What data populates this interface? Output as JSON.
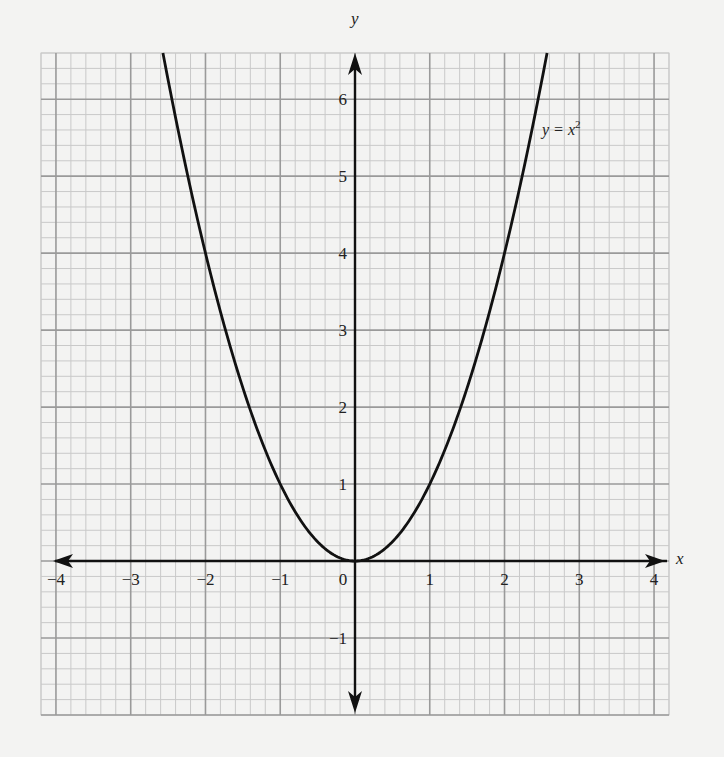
{
  "chart_data": {
    "type": "line",
    "title": "",
    "xlabel": "x",
    "ylabel": "y",
    "xlim": [
      -4.2,
      4.2
    ],
    "ylim": [
      -2,
      6.6
    ],
    "grid": true,
    "grid_minor_step": 0.2,
    "grid_major_step": 1,
    "x_ticks": [
      -4,
      -3,
      -2,
      -1,
      0,
      1,
      2,
      3,
      4
    ],
    "x_tick_labels": [
      "−4",
      "−3",
      "−2",
      "−1",
      "0",
      "1",
      "2",
      "3",
      "4"
    ],
    "y_ticks": [
      -1,
      1,
      2,
      3,
      4,
      5,
      6
    ],
    "y_tick_labels": [
      "−1",
      "1",
      "2",
      "3",
      "4",
      "5",
      "6"
    ],
    "series": [
      {
        "name": "y = x^2",
        "function": "x^2",
        "x": [
          -2.6,
          -2.4,
          -2.2,
          -2,
          -1.8,
          -1.6,
          -1.4,
          -1.2,
          -1,
          -0.8,
          -0.6,
          -0.4,
          -0.2,
          0,
          0.2,
          0.4,
          0.6,
          0.8,
          1,
          1.2,
          1.4,
          1.6,
          1.8,
          2,
          2.2,
          2.4,
          2.6
        ],
        "values": [
          6.76,
          5.76,
          4.84,
          4,
          3.24,
          2.56,
          1.96,
          1.44,
          1,
          0.64,
          0.36,
          0.16,
          0.04,
          0,
          0.04,
          0.16,
          0.36,
          0.64,
          1,
          1.44,
          1.96,
          2.56,
          3.24,
          4,
          4.84,
          5.76,
          6.76
        ]
      }
    ],
    "annotations": [
      {
        "text_base": "y = x",
        "superscript": "2",
        "x": 2.55,
        "y": 5.8
      }
    ],
    "axes_arrows": true
  },
  "labels": {
    "x_axis": "x",
    "y_axis": "y",
    "curve_label_base": "y = x",
    "curve_label_sup": "2"
  },
  "colors": {
    "background": "#f3f3f2",
    "minor_grid": "#c9c9c9",
    "major_grid": "#9a9a9a",
    "axis": "#111111",
    "curve": "#111111"
  }
}
